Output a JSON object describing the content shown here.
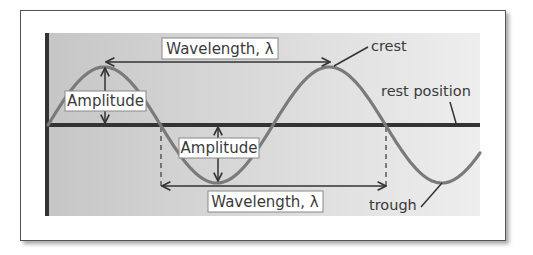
{
  "diagram": {
    "colors": {
      "background_left": "#c6c6c6",
      "background_right": "#eeeeee",
      "axis": "#333333",
      "wave": "#7a7a7a",
      "arrow": "#333333",
      "label_box_fill": "#ffffff",
      "label_box_stroke": "#888888",
      "text": "#3a3a3a"
    },
    "labels": {
      "wavelength_top": "Wavelength, λ",
      "wavelength_bottom": "Wavelength, λ",
      "amplitude_left": "Amplitude",
      "amplitude_middle": "Amplitude",
      "crest": "crest",
      "rest_position": "rest position",
      "trough": "trough"
    },
    "wave": {
      "rest_y": 125,
      "amplitude_px": 58,
      "period_px": 225,
      "start_x": 48,
      "end_x": 480
    }
  }
}
